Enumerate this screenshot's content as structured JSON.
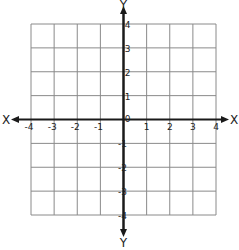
{
  "diagram": {
    "type": "coordinate-plane",
    "x_axis_label": "X",
    "x_axis_label_right": "X",
    "y_axis_label_top": "Y",
    "y_axis_label_bottom": "Y",
    "x_range": [
      -4,
      4
    ],
    "y_range": [
      -4,
      4
    ],
    "grid_step": 1,
    "x_ticks": [
      {
        "value": -4,
        "label": "-4"
      },
      {
        "value": -3,
        "label": "-3"
      },
      {
        "value": -2,
        "label": "-2"
      },
      {
        "value": -1,
        "label": "-1"
      },
      {
        "value": 1,
        "label": "1"
      },
      {
        "value": 2,
        "label": "2"
      },
      {
        "value": 3,
        "label": "3"
      },
      {
        "value": 4,
        "label": "4"
      }
    ],
    "y_ticks": [
      {
        "value": 4,
        "label": "4"
      },
      {
        "value": 3,
        "label": "3"
      },
      {
        "value": 2,
        "label": "2"
      },
      {
        "value": 1,
        "label": "1"
      },
      {
        "value": -1,
        "label": "-1"
      },
      {
        "value": -2,
        "label": "-2"
      },
      {
        "value": -3,
        "label": "-3"
      },
      {
        "value": -4,
        "label": "-4"
      }
    ],
    "origin_label": "0",
    "colors": {
      "grid": "#8a8a8a",
      "axis": "#1a1a1a",
      "background": "#ffffff"
    }
  }
}
